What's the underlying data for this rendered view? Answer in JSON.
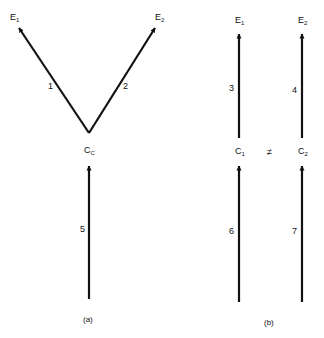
{
  "diagram": {
    "panel_a": {
      "caption": "(a)",
      "nodes": {
        "e1": {
          "base": "E",
          "sub": "1"
        },
        "e2": {
          "base": "E",
          "sub": "2"
        },
        "cc": {
          "base": "C",
          "sub": "C"
        }
      },
      "edges": [
        {
          "id": "1",
          "from": "cc",
          "to": "e1"
        },
        {
          "id": "2",
          "from": "cc",
          "to": "e2"
        },
        {
          "id": "5",
          "from": "bottom",
          "to": "cc"
        }
      ]
    },
    "panel_b": {
      "caption": "(b)",
      "nodes": {
        "e1": {
          "base": "E",
          "sub": "1"
        },
        "e2": {
          "base": "E",
          "sub": "2"
        },
        "c1": {
          "base": "C",
          "sub": "1"
        },
        "c2": {
          "base": "C",
          "sub": "2"
        }
      },
      "relation": "≠",
      "edges": [
        {
          "id": "3",
          "from": "c1",
          "to": "e1"
        },
        {
          "id": "4",
          "from": "c2",
          "to": "e2"
        },
        {
          "id": "6",
          "from": "bottom",
          "to": "c1"
        },
        {
          "id": "7",
          "from": "bottom",
          "to": "c2"
        }
      ]
    }
  }
}
